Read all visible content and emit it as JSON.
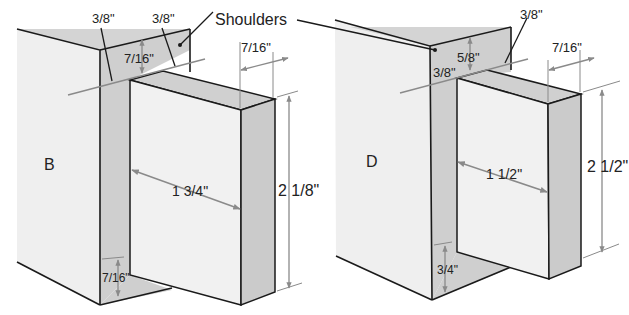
{
  "colors": {
    "face_light": "#efefef",
    "face_gray": "#cfcfcf",
    "edge": "#1a1a1a",
    "dimension": "#8a8a8a",
    "text": "#222222"
  },
  "callout": {
    "label": "Shoulders"
  },
  "diagrams": [
    {
      "id": "B",
      "label": "B",
      "dimensions": {
        "shoulder_left": "3/8\"",
        "shoulder_right": "3/8\"",
        "top_shoulder": "7/16\"",
        "tenon_thickness": "7/16\"",
        "tenon_length": "1 3/4\"",
        "tenon_height": "2 1/8\"",
        "bottom_shoulder": "7/16\""
      }
    },
    {
      "id": "D",
      "label": "D",
      "dimensions": {
        "shoulder_right": "3/8\"",
        "top_shoulder": "5/8\"",
        "shoulder_left": "3/8\"",
        "tenon_thickness": "7/16\"",
        "tenon_length": "1 1/2\"",
        "tenon_height": "2 1/2\"",
        "bottom_shoulder": "3/4\""
      }
    }
  ]
}
